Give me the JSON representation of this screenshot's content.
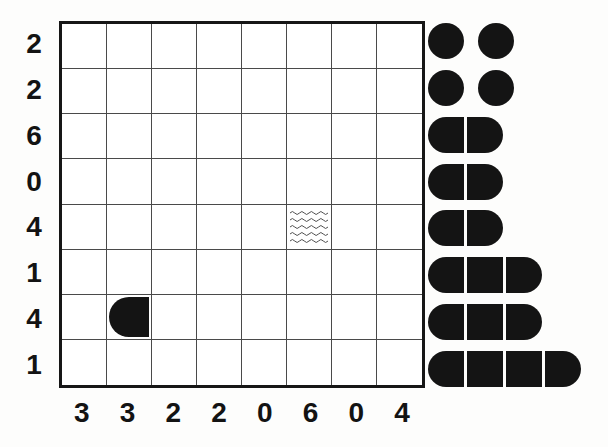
{
  "puzzle": {
    "name": "Battleship Solitaire",
    "grid_size": 8,
    "row_clues": [
      "2",
      "2",
      "6",
      "0",
      "4",
      "1",
      "4",
      "1"
    ],
    "col_clues": [
      "3",
      "3",
      "2",
      "2",
      "0",
      "6",
      "0",
      "4"
    ],
    "colors": {
      "ship": "#141414",
      "grid_line": "#4a4a4a",
      "border": "#161616",
      "background": "#fdfdfc",
      "water_line": "#4a4a4a"
    },
    "given_cells": [
      {
        "row": 7,
        "col": 2,
        "kind": "ship-left-end",
        "icon": "ship-left-end-icon"
      },
      {
        "row": 5,
        "col": 6,
        "kind": "water",
        "icon": "water-waves-icon"
      }
    ],
    "cells": [
      [
        "empty",
        "empty",
        "empty",
        "empty",
        "empty",
        "empty",
        "empty",
        "empty"
      ],
      [
        "empty",
        "empty",
        "empty",
        "empty",
        "empty",
        "empty",
        "empty",
        "empty"
      ],
      [
        "empty",
        "empty",
        "empty",
        "empty",
        "empty",
        "empty",
        "empty",
        "empty"
      ],
      [
        "empty",
        "empty",
        "empty",
        "empty",
        "empty",
        "empty",
        "empty",
        "empty"
      ],
      [
        "empty",
        "empty",
        "empty",
        "empty",
        "empty",
        "water",
        "empty",
        "empty"
      ],
      [
        "empty",
        "empty",
        "empty",
        "empty",
        "empty",
        "empty",
        "empty",
        "empty"
      ],
      [
        "empty",
        "left",
        "empty",
        "empty",
        "empty",
        "empty",
        "empty",
        "empty"
      ],
      [
        "empty",
        "empty",
        "empty",
        "empty",
        "empty",
        "empty",
        "empty",
        "empty"
      ]
    ]
  },
  "fleet": {
    "label": "Fleet",
    "rows": [
      {
        "size": 1,
        "count_in_row": 2,
        "segments": [
          "sub",
          "gap",
          "sub"
        ]
      },
      {
        "size": 1,
        "count_in_row": 2,
        "segments": [
          "sub",
          "gap",
          "sub"
        ]
      },
      {
        "size": 2,
        "count_in_row": 1,
        "segments": [
          "left",
          "right"
        ]
      },
      {
        "size": 2,
        "count_in_row": 1,
        "segments": [
          "left",
          "right"
        ]
      },
      {
        "size": 2,
        "count_in_row": 1,
        "segments": [
          "left",
          "right"
        ]
      },
      {
        "size": 3,
        "count_in_row": 1,
        "segments": [
          "left",
          "middle",
          "right"
        ]
      },
      {
        "size": 3,
        "count_in_row": 1,
        "segments": [
          "left",
          "middle",
          "right"
        ]
      },
      {
        "size": 4,
        "count_in_row": 1,
        "segments": [
          "left",
          "middle",
          "middle",
          "right"
        ]
      }
    ],
    "summary": {
      "submarines": 4,
      "destroyers": 3,
      "cruisers": 2,
      "battleships": 1
    }
  }
}
